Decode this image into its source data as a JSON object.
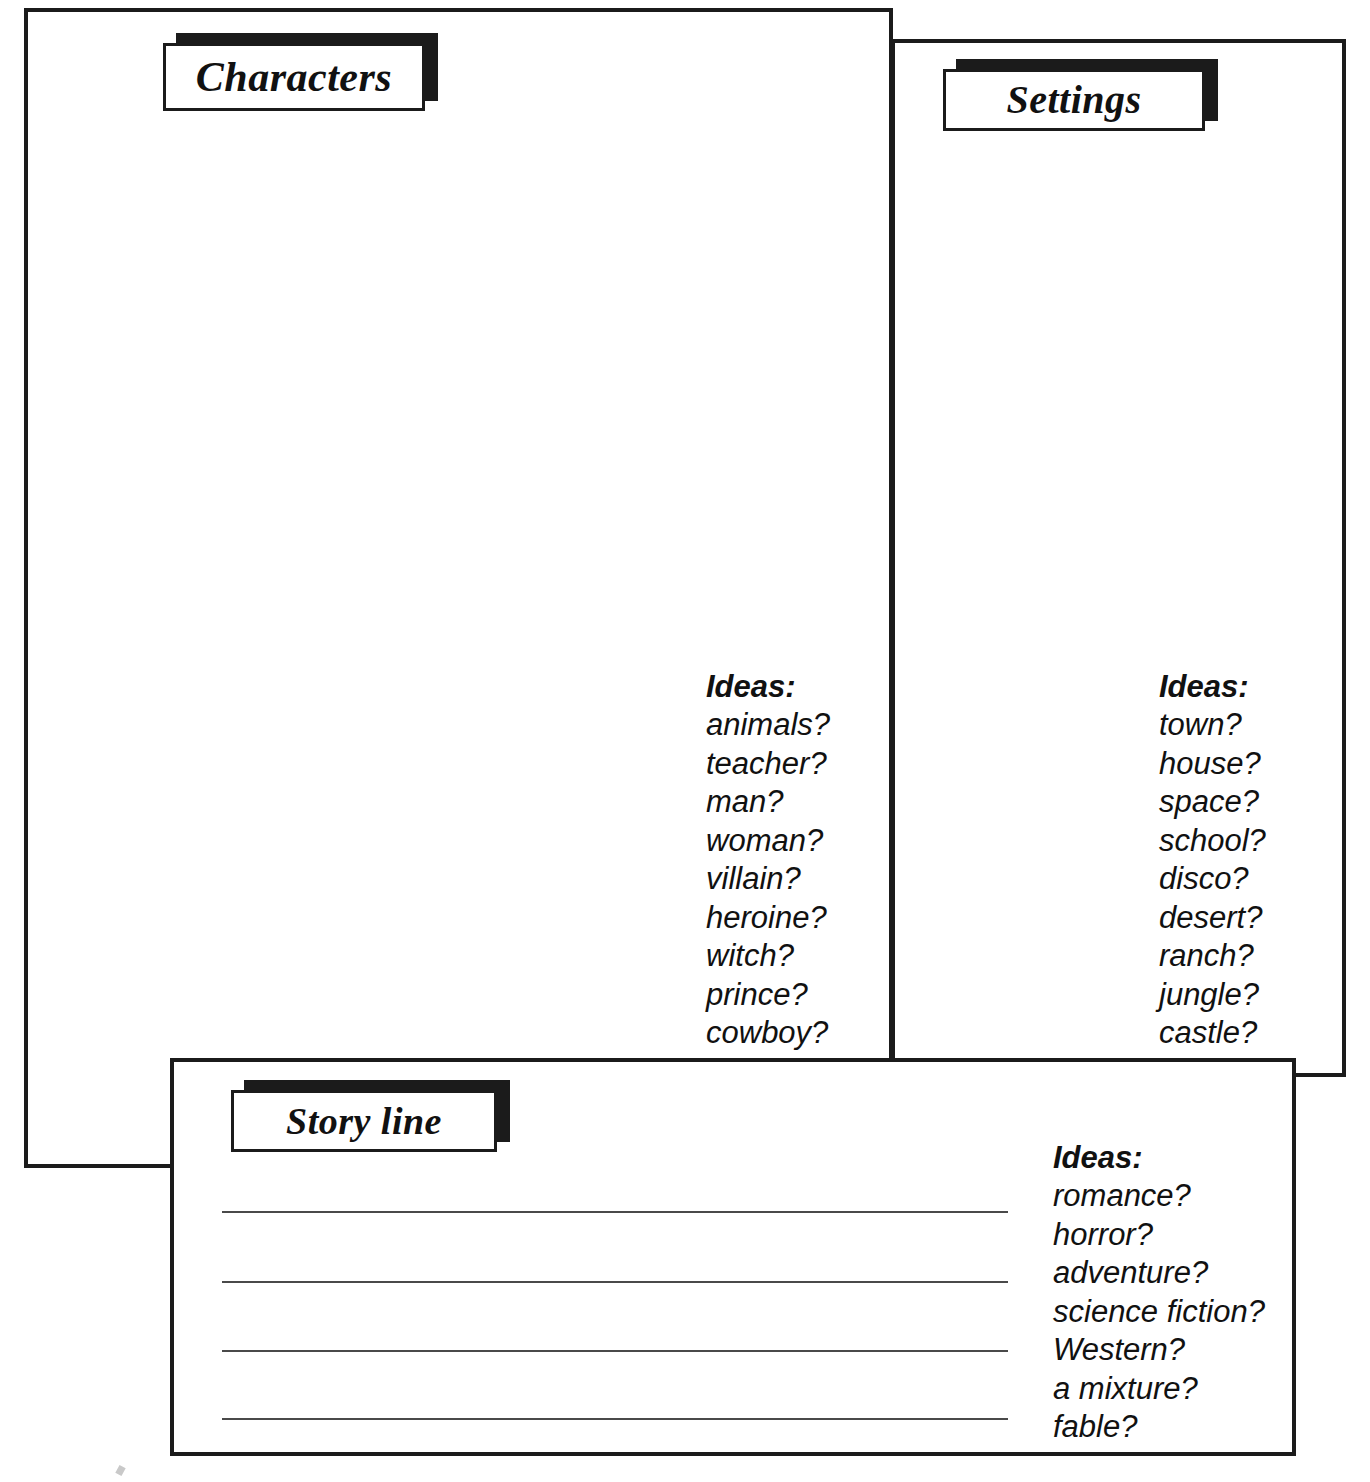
{
  "worksheet": {
    "title": "Story Planning Worksheet",
    "ink_color": "#1b1b1b",
    "paper_color": "#ffffff",
    "rule_color": "#4a4a4a"
  },
  "panels": {
    "characters": {
      "title": "Characters",
      "ideas_heading": "Ideas:",
      "ideas": [
        "animals?",
        "teacher?",
        "man?",
        "woman?",
        "villain?",
        "heroine?",
        "witch?",
        "prince?",
        "cowboy?"
      ]
    },
    "settings": {
      "title": "Settings",
      "ideas_heading": "Ideas:",
      "ideas": [
        "town?",
        "house?",
        "space?",
        "school?",
        "disco?",
        "desert?",
        "ranch?",
        "jungle?",
        "castle?"
      ]
    },
    "storyline": {
      "title": "Story line",
      "ideas_heading": "Ideas:",
      "ideas": [
        "romance?",
        "horror?",
        "adventure?",
        "science fiction?",
        "Western?",
        "a mixture?",
        "fable?"
      ],
      "writing_lines": [
        "",
        "",
        "",
        ""
      ]
    }
  }
}
